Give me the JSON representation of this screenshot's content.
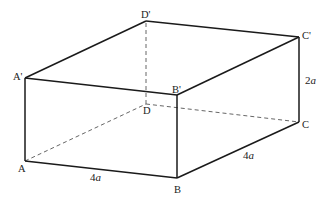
{
  "diagram": {
    "type": "rectangular-cuboid",
    "vertices": {
      "A": {
        "label": "A",
        "x": 25,
        "y": 161
      },
      "B": {
        "label": "B",
        "x": 177,
        "y": 178
      },
      "C": {
        "label": "C",
        "x": 299,
        "y": 122
      },
      "D": {
        "label": "D",
        "x": 146,
        "y": 104
      },
      "A1": {
        "label": "A'",
        "x": 25,
        "y": 78
      },
      "B1": {
        "label": "B'",
        "x": 177,
        "y": 95
      },
      "C1": {
        "label": "C'",
        "x": 299,
        "y": 37
      },
      "D1": {
        "label": "D'",
        "x": 146,
        "y": 21
      }
    },
    "dimensions": {
      "AB": "4a",
      "BC": "4a",
      "CC1": "2a"
    },
    "colors": {
      "edge": "#1a1a1a",
      "hidden_edge": "#555555",
      "background": "#ffffff"
    }
  }
}
